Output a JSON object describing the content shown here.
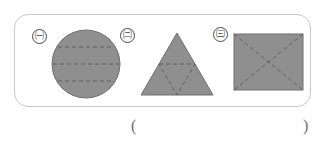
{
  "figure": {
    "name": "shapes-with-dashed-lines-figure",
    "border_color": "#c9c9c9",
    "shape_fill": "#8f8f8f",
    "shape_stroke": "#6f6f6f",
    "dash_color": "#5a5a5a",
    "items": [
      {
        "marker": "㈠",
        "marker_plain": "ㄱ",
        "shape": "circle",
        "shape_label": "circle-with-three-horizontal-dashed-chords",
        "dashed_lines": 3,
        "dash_orientation": "horizontal"
      },
      {
        "marker": "㈡",
        "marker_plain": "ㄴ",
        "shape": "triangle",
        "shape_label": "triangle-with-inverted-dashed-midpoint-triangle",
        "dashed_lines": 3,
        "dash_orientation": "inner-triangle"
      },
      {
        "marker": "㈢",
        "marker_plain": "ㄷ",
        "shape": "rectangle",
        "shape_label": "rectangle-with-dashed-diagonals",
        "dashed_lines": 2,
        "dash_orientation": "diagonal-cross"
      }
    ]
  },
  "answer": {
    "paren_open": "(",
    "paren_close": ")",
    "value": ""
  }
}
